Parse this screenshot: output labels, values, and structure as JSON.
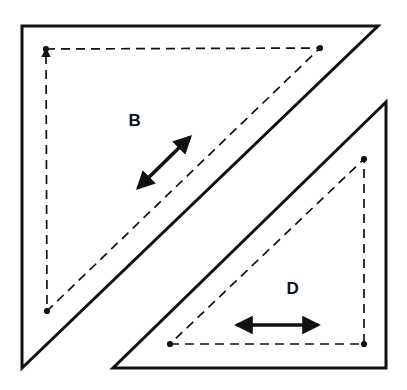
{
  "figure": {
    "canvas": {
      "width": 407,
      "height": 390,
      "background": "#ffffff"
    },
    "stroke_color": "#111111",
    "labels": [
      {
        "id": "label-b",
        "text": "B",
        "x": 135,
        "y": 122
      },
      {
        "id": "label-d",
        "text": "D",
        "x": 293,
        "y": 290
      }
    ],
    "solid_triangles": [
      {
        "id": "triangle-upper-left",
        "points": "22,26 378,26 22,368",
        "vertices": [
          [
            22,
            26
          ],
          [
            378,
            26
          ],
          [
            22,
            368
          ]
        ]
      },
      {
        "id": "triangle-lower-right",
        "points": "113,368 386,368 386,102",
        "vertices": [
          [
            113,
            368
          ],
          [
            386,
            368
          ],
          [
            386,
            102
          ]
        ]
      }
    ],
    "dashed_triangles": [
      {
        "id": "dashed-triangle-b",
        "points": "46,49 320,48 47,311 46,49",
        "dots": [
          [
            46,
            49
          ],
          [
            320,
            48
          ],
          [
            47,
            311
          ]
        ]
      },
      {
        "id": "dashed-triangle-d",
        "points": "170,344 364,344 364,159 170,344",
        "dots": [
          [
            170,
            344
          ],
          [
            364,
            344
          ],
          [
            364,
            159
          ]
        ]
      }
    ],
    "arrows": [
      {
        "id": "arrow-b",
        "label": "B",
        "direction": "diagonal-double",
        "from": [
          138,
          188
        ],
        "to": [
          190,
          137
        ]
      },
      {
        "id": "arrow-d",
        "label": "D",
        "direction": "horizontal-double",
        "from": [
          237,
          325
        ],
        "to": [
          318,
          325
        ]
      }
    ],
    "dot_radius": 3.1,
    "caption": ""
  }
}
